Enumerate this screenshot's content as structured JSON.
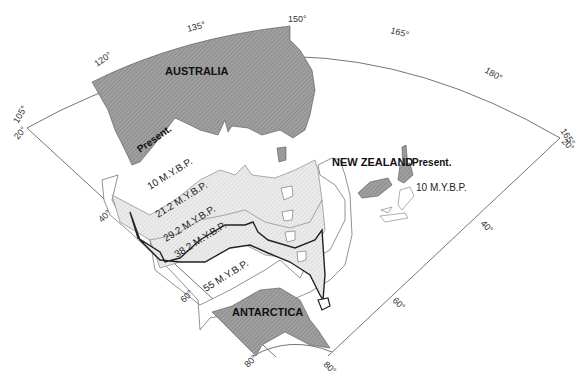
{
  "map": {
    "type": "paleogeographic reconstruction",
    "continents": {
      "australia": "AUSTRALIA",
      "antarctica": "ANTARCTICA",
      "new_zealand": "NEW ZEALAND"
    },
    "ages": {
      "present_aus": "Present.",
      "present_nz": "Present.",
      "nz_10": "10 M.Y.B.P.",
      "a10": "10 M.Y.B.P.",
      "a21": "21.2 M.Y.B.P.",
      "a29": "29.2 M.Y.B.P.",
      "a38": "38.2 M.Y.B.P.",
      "a55": "55 M.Y.B.P."
    },
    "longitude_ticks": [
      "105°",
      "120°",
      "135°",
      "150°",
      "165°",
      "180°",
      "165°"
    ],
    "latitude_ticks_left": [
      "20°",
      "40°",
      "60°",
      "80°"
    ],
    "latitude_ticks_right": [
      "20°",
      "40°",
      "60°",
      "80°"
    ],
    "colors": {
      "present_land": "#9a9a9a",
      "stage_fill": "#e4e4e4",
      "outline": "#222222",
      "frame": "#555555"
    }
  }
}
